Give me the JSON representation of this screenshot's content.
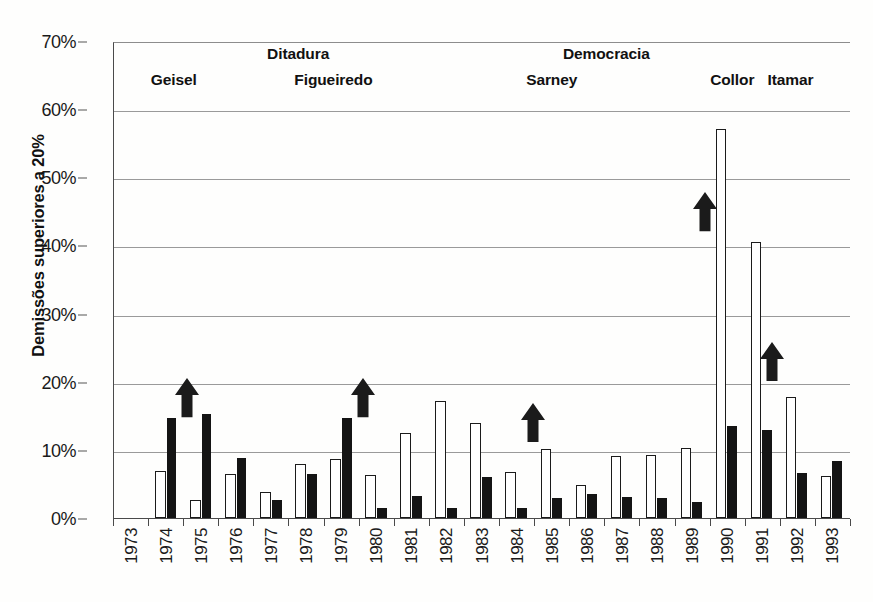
{
  "axes": {
    "ylabel": "Demissões superiores a 20%",
    "yticks": [
      "0%",
      "10%",
      "20%",
      "30%",
      "40%",
      "50%",
      "60%",
      "70%"
    ],
    "ytick_values": [
      0,
      10,
      20,
      30,
      40,
      50,
      60,
      70
    ],
    "ylim": [
      0,
      70
    ],
    "xlabel": ""
  },
  "eras": [
    {
      "name": "era-ditadura",
      "label": "Ditadura",
      "left_pct": 20.8,
      "span_years": "1973-1984"
    },
    {
      "name": "era-democracia",
      "label": "Democracia",
      "left_pct": 61.0,
      "span_years": "1985-1993"
    }
  ],
  "presidents": [
    {
      "name": "president-geisel",
      "label": "Geisel",
      "left_pct": 5.0
    },
    {
      "name": "president-figueiredo",
      "label": "Figueiredo",
      "left_pct": 24.5
    },
    {
      "name": "president-sarney",
      "label": "Sarney",
      "left_pct": 56.0
    },
    {
      "name": "president-collor",
      "label": "Collor",
      "left_pct": 81.0
    },
    {
      "name": "president-itamar",
      "label": "Itamar",
      "left_pct": 88.8
    }
  ],
  "arrows": [
    {
      "name": "arrow-1974",
      "year": "1974",
      "x_pct": 8.2,
      "tip_pct": 20.6,
      "tail_pct": 14.8
    },
    {
      "name": "arrow-1979",
      "year": "1979",
      "x_pct": 32.0,
      "tip_pct": 20.6,
      "tail_pct": 14.8
    },
    {
      "name": "arrow-1985",
      "year": "1985",
      "x_pct": 55.2,
      "tip_pct": 17.0,
      "tail_pct": 11.2
    },
    {
      "name": "arrow-1990",
      "year": "1990",
      "x_pct": 78.5,
      "tip_pct": 48.0,
      "tail_pct": 42.2
    },
    {
      "name": "arrow-1992",
      "year": "1992",
      "x_pct": 87.6,
      "tip_pct": 26.0,
      "tail_pct": 20.2
    }
  ],
  "chart_data": {
    "type": "bar",
    "title": "",
    "subtitle": "",
    "xlabel": "",
    "ylabel": "Demissões superiores a 20%",
    "ylim": [
      0,
      70
    ],
    "ytick_labels": [
      "0%",
      "10%",
      "20%",
      "30%",
      "40%",
      "50%",
      "60%",
      "70%"
    ],
    "grid": true,
    "legend": "none",
    "categories": [
      "1973",
      "1974",
      "1975",
      "1976",
      "1977",
      "1978",
      "1979",
      "1980",
      "1981",
      "1982",
      "1983",
      "1984",
      "1985",
      "1986",
      "1987",
      "1988",
      "1989",
      "1990",
      "1991",
      "1992",
      "1993"
    ],
    "series": [
      {
        "name": "serie-branca",
        "style": "white-outlined",
        "color": "#ffffff",
        "values": [
          0,
          7.0,
          2.6,
          6.5,
          3.9,
          8.0,
          8.7,
          6.3,
          12.6,
          17.2,
          14.0,
          6.8,
          10.2,
          4.9,
          9.2,
          9.3,
          10.3,
          57.4,
          40.7,
          17.9,
          6.2
        ]
      },
      {
        "name": "serie-preta",
        "style": "solid-black",
        "color": "#141414",
        "values": [
          0,
          14.8,
          15.4,
          8.8,
          2.6,
          6.5,
          14.7,
          1.5,
          3.3,
          1.5,
          6.1,
          1.5,
          2.9,
          3.6,
          3.1,
          3.0,
          2.4,
          13.5,
          13.0,
          6.7,
          8.4
        ]
      }
    ],
    "annotations": [
      {
        "label": "Ditadura",
        "type": "era-bracket"
      },
      {
        "label": "Democracia",
        "type": "era-bracket"
      },
      {
        "label": "Geisel",
        "type": "president"
      },
      {
        "label": "Figueiredo",
        "type": "president"
      },
      {
        "label": "Sarney",
        "type": "president"
      },
      {
        "label": "Collor",
        "type": "president"
      },
      {
        "label": "Itamar",
        "type": "president"
      },
      {
        "label": "up-arrow",
        "type": "marker",
        "at": "1974"
      },
      {
        "label": "up-arrow",
        "type": "marker",
        "at": "1979"
      },
      {
        "label": "up-arrow",
        "type": "marker",
        "at": "1985"
      },
      {
        "label": "up-arrow",
        "type": "marker",
        "at": "1990"
      },
      {
        "label": "up-arrow",
        "type": "marker",
        "at": "1992"
      }
    ]
  }
}
